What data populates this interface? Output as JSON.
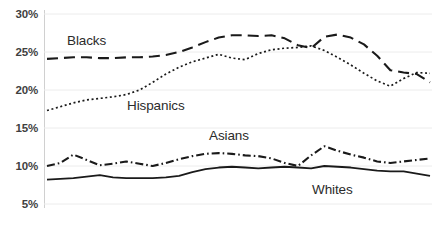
{
  "chart_data": {
    "type": "line",
    "title": "",
    "xlabel": "",
    "ylabel": "",
    "ylim": [
      5,
      30
    ],
    "yticks": [
      "5%",
      "10%",
      "15%",
      "20%",
      "25%",
      "30%"
    ],
    "ytick_values": [
      5,
      10,
      15,
      20,
      25,
      30
    ],
    "grid": true,
    "legend_position": "inline-labels",
    "xticks": [],
    "x": [
      0,
      1,
      2,
      3,
      4,
      5,
      6,
      7,
      8,
      9,
      10,
      11,
      12,
      13,
      14,
      15,
      16,
      17,
      18,
      19,
      20,
      21,
      22,
      23,
      24,
      25,
      26,
      27,
      28,
      29
    ],
    "series": [
      {
        "name": "Blacks",
        "style": "dashed",
        "color": "#1a1a1a",
        "values": [
          24.1,
          24.2,
          24.3,
          24.3,
          24.2,
          24.2,
          24.3,
          24.3,
          24.4,
          24.6,
          25.0,
          25.6,
          26.3,
          26.9,
          27.2,
          27.2,
          27.1,
          27.2,
          26.8,
          25.9,
          25.5,
          27.0,
          27.3,
          26.9,
          26.0,
          24.5,
          22.6,
          22.3,
          22.1,
          21.0
        ]
      },
      {
        "name": "Hispanics",
        "style": "dotted",
        "color": "#1a1a1a",
        "values": [
          17.3,
          17.8,
          18.3,
          18.7,
          18.9,
          19.1,
          19.4,
          20.0,
          21.0,
          22.1,
          23.0,
          23.7,
          24.2,
          24.7,
          24.2,
          24.0,
          24.8,
          25.3,
          25.5,
          25.6,
          25.8,
          25.2,
          24.3,
          23.3,
          22.2,
          21.2,
          20.5,
          21.5,
          22.3,
          22.2
        ]
      },
      {
        "name": "Asians",
        "style": "dash-dot",
        "color": "#1a1a1a",
        "values": [
          10.0,
          10.4,
          11.5,
          10.8,
          10.1,
          10.3,
          10.6,
          10.3,
          10.0,
          10.4,
          10.9,
          11.3,
          11.6,
          11.7,
          11.6,
          11.4,
          11.3,
          11.0,
          10.4,
          10.0,
          11.4,
          12.6,
          12.0,
          11.5,
          11.1,
          10.6,
          10.4,
          10.6,
          10.8,
          11.0
        ]
      },
      {
        "name": "Whites",
        "style": "solid",
        "color": "#1a1a1a",
        "values": [
          8.2,
          8.3,
          8.4,
          8.6,
          8.8,
          8.5,
          8.4,
          8.4,
          8.4,
          8.5,
          8.7,
          9.2,
          9.6,
          9.8,
          9.9,
          9.8,
          9.7,
          9.8,
          9.9,
          9.8,
          9.7,
          10.0,
          9.9,
          9.8,
          9.6,
          9.4,
          9.3,
          9.3,
          9.0,
          8.7
        ]
      }
    ],
    "series_labels": [
      {
        "text": "Blacks",
        "x": 67,
        "y": 33
      },
      {
        "text": "Hispanics",
        "x": 127,
        "y": 98
      },
      {
        "text": "Asians",
        "x": 209,
        "y": 128
      },
      {
        "text": "Whites",
        "x": 312,
        "y": 182
      }
    ]
  }
}
